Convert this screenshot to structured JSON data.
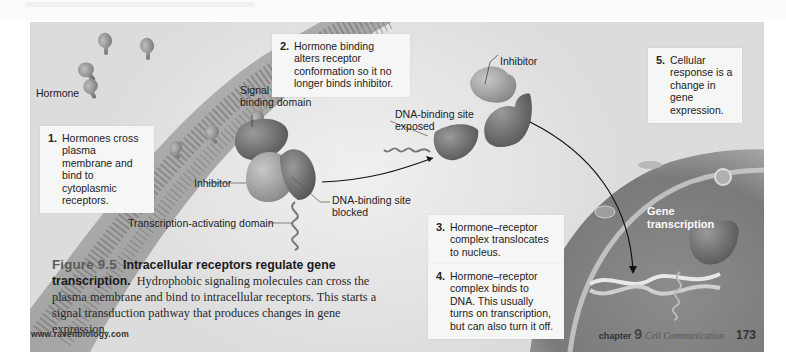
{
  "figure": {
    "number": "Figure 9.5",
    "title": "Intracellular receptors regulate gene transcription.",
    "caption": "Hydrophobic signaling molecules can cross the plasma membrane and bind to intracellular receptors. This starts a signal transduction pathway that produces changes in gene expression."
  },
  "steps": [
    {
      "num": "1.",
      "text": "Hormones cross plasma membrane and bind to cytoplasmic receptors."
    },
    {
      "num": "2.",
      "text": "Hormone binding alters receptor conformation so it no longer binds inhibitor."
    },
    {
      "num": "3.",
      "text": "Hormone–receptor complex translocates to nucleus."
    },
    {
      "num": "4.",
      "text": "Hormone–receptor complex binds to DNA. This usually turns on transcription, but can also turn it off."
    },
    {
      "num": "5.",
      "text": "Cellular response is a change in gene expression."
    }
  ],
  "labels": {
    "hormone": "Hormone",
    "signal_domain": "Signal molecule-binding domain",
    "inhibitor_left": "Inhibitor",
    "dna_blocked": "DNA-binding site blocked",
    "transcription_domain": "Transcription-activating domain",
    "inhibitor_right": "Inhibitor",
    "dna_exposed": "DNA-binding site exposed",
    "gene_transcription": "Gene transcription"
  },
  "footer": {
    "url": "www.ravenbiology.com",
    "chapter_word": "chapter",
    "chapter_number": "9",
    "chapter_title": "Cell Communication",
    "page_number": "173"
  }
}
